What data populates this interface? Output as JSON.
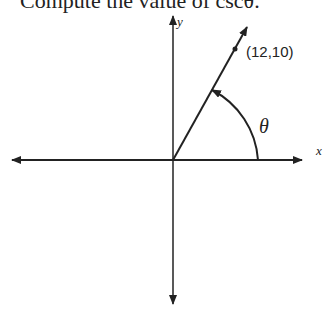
{
  "heading": "Compute the value of cscθ.",
  "diagram": {
    "x_axis_label": "x",
    "y_axis_label": "y",
    "point_label": "(12,10)",
    "angle_label": "θ",
    "point": {
      "x": 12,
      "y": 10
    },
    "colors": {
      "stroke": "#222222",
      "background": "#ffffff"
    }
  }
}
